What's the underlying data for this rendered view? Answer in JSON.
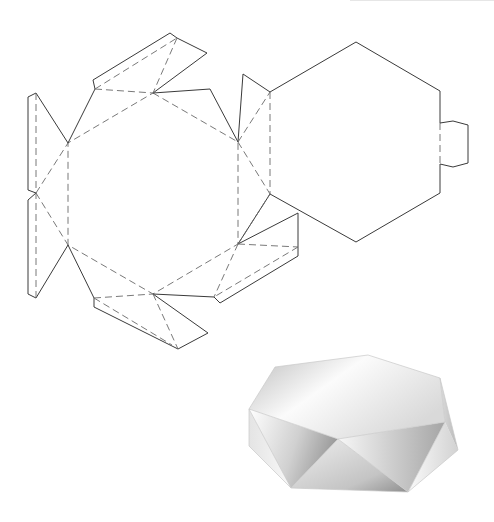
{
  "diagram": {
    "title": "",
    "legend": {
      "cut_line": "solid",
      "fold_line": "dashed"
    },
    "colors": {
      "cut_stroke": "#3a3a3a",
      "fold_stroke": "#6a6a6a",
      "box_light": "#f4f4f4",
      "box_mid": "#d6d6d6",
      "box_dark": "#a9a9a9"
    },
    "parts": [
      {
        "name": "base-hexagon",
        "type": "fold-outline",
        "points": [
          [
            153,
            93
          ],
          [
            238,
            142
          ],
          [
            238,
            244
          ],
          [
            153,
            294
          ],
          [
            68,
            245
          ],
          [
            68,
            143
          ]
        ]
      },
      {
        "name": "lid-hexagon",
        "type": "cut-outline",
        "points": [
          [
            356,
            42
          ],
          [
            440,
            91
          ],
          [
            440,
            193
          ],
          [
            356,
            242
          ],
          [
            270,
            194
          ],
          [
            270,
            92
          ]
        ]
      },
      {
        "name": "lid-tab",
        "type": "cut-outline",
        "points": [
          [
            440,
            123
          ],
          [
            453,
            121
          ],
          [
            468,
            125
          ],
          [
            468,
            163
          ],
          [
            453,
            167
          ],
          [
            440,
            164
          ]
        ]
      },
      {
        "name": "left-side-panels",
        "type": "cut-outline"
      },
      {
        "name": "top-side-panel",
        "type": "cut-outline"
      },
      {
        "name": "upper-right-side-panel",
        "type": "cut-outline"
      },
      {
        "name": "lower-right-side-panel",
        "type": "cut-outline"
      },
      {
        "name": "bottom-side-panel",
        "type": "cut-outline"
      },
      {
        "name": "assembled-box-3d",
        "type": "illustration"
      }
    ]
  }
}
